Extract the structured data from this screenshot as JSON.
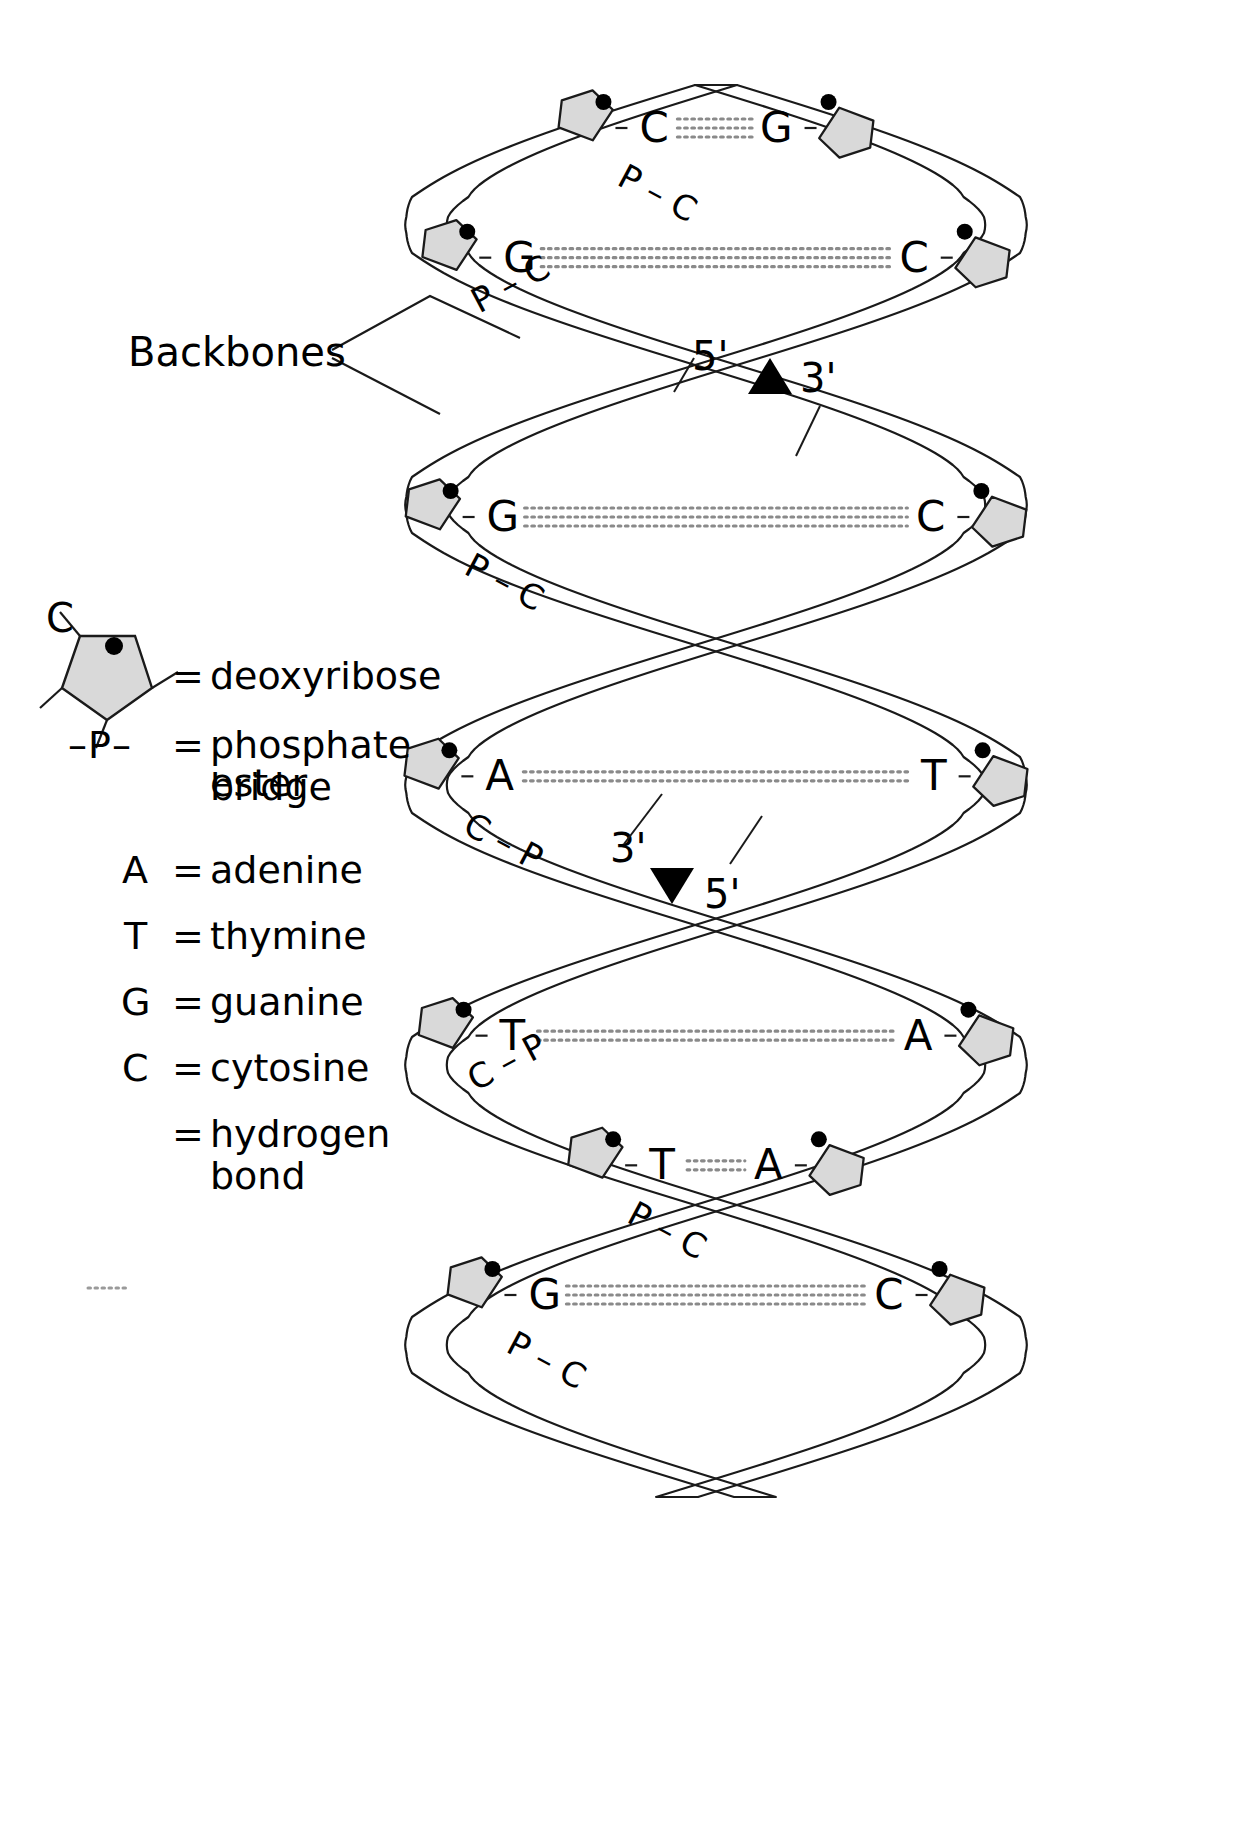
{
  "figure": {
    "title_visible": false,
    "background_color": "#ffffff",
    "line_color": "#1a1a1a",
    "sugar_fill": "#d9d9d9",
    "sugar_stroke": "#1a1a1a",
    "phosphate_dot_color": "#000000"
  },
  "annotations": {
    "backbones_label": "Backbones",
    "polarity_top": {
      "five_prime": "5'",
      "three_prime": "3'",
      "arrow": "▲"
    },
    "polarity_bottom": {
      "three_prime": "3'",
      "five_prime": "5'",
      "arrow": "▼"
    }
  },
  "legend": {
    "items": [
      {
        "symbol_kind": "pentagon",
        "symbol": "C",
        "equals": "=",
        "label": "deoxyribose"
      },
      {
        "symbol_kind": "text",
        "symbol": "–P–",
        "equals": "=",
        "label": "phosphate ester",
        "label2": "bridge"
      },
      {
        "symbol_kind": "text",
        "symbol": "A",
        "equals": "=",
        "label": "adenine"
      },
      {
        "symbol_kind": "text",
        "symbol": "T",
        "equals": "=",
        "label": "thymine"
      },
      {
        "symbol_kind": "text",
        "symbol": "G",
        "equals": "=",
        "label": "guanine"
      },
      {
        "symbol_kind": "text",
        "symbol": "C",
        "equals": "=",
        "label": "cytosine"
      },
      {
        "symbol_kind": "dots",
        "symbol": "....",
        "equals": "=",
        "label": "hydrogen",
        "label2": "bond"
      }
    ]
  },
  "base_pairs": [
    {
      "left": "C",
      "right": "G",
      "bonds": 3
    },
    {
      "left": "G",
      "right": "C",
      "bonds": 3
    },
    {
      "left": "G",
      "right": "C",
      "bonds": 3
    },
    {
      "left": "G",
      "right": "C",
      "bonds": 3
    },
    {
      "left": "C",
      "right": "G",
      "bonds": 3
    },
    {
      "left": "A",
      "right": "T",
      "bonds": 2
    },
    {
      "left": "T",
      "right": "A",
      "bonds": 2
    },
    {
      "left": "T",
      "right": "A",
      "bonds": 2
    },
    {
      "left": "T",
      "right": "A",
      "bonds": 2
    },
    {
      "left": "G",
      "right": "C",
      "bonds": 3
    }
  ],
  "backbone_labels": [
    {
      "text": "P – C"
    },
    {
      "text": "P – C"
    },
    {
      "text": "P – C"
    },
    {
      "text": "P – C"
    },
    {
      "text": "C – P"
    },
    {
      "text": "C – P"
    },
    {
      "text": "C – P"
    },
    {
      "text": "C – P"
    },
    {
      "text": "P – C"
    },
    {
      "text": "P – C"
    }
  ],
  "helix_geometry": {
    "axis_x": 716,
    "amplitude": 290,
    "period": 560,
    "ribbon_width": 40,
    "top": 85,
    "bottom": 1500
  }
}
